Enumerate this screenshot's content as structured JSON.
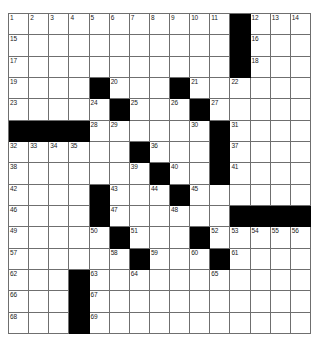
{
  "puzzle": {
    "type": "crossword-grid",
    "rows": 15,
    "columns": 15,
    "cell_color": "#ffffff",
    "block_color": "#000000",
    "line_color": "#6f6f6f",
    "number_color": "#1a1a1a",
    "grid": [
      [
        {
          "n": "1"
        },
        {
          "n": "2"
        },
        {
          "n": "3"
        },
        {
          "n": "4"
        },
        {
          "n": "5"
        },
        {
          "n": "6"
        },
        {
          "n": "7"
        },
        {
          "n": "8"
        },
        {
          "n": "9"
        },
        {
          "n": "10"
        },
        {
          "n": "11"
        },
        {
          "b": true
        },
        {
          "n": "12"
        },
        {
          "n": "13"
        },
        {
          "n": "14"
        }
      ],
      [
        {
          "n": "15"
        },
        {},
        {},
        {},
        {},
        {},
        {},
        {},
        {},
        {},
        {},
        {
          "b": true
        },
        {
          "n": "16"
        },
        {},
        {}
      ],
      [
        {
          "n": "17"
        },
        {},
        {},
        {},
        {},
        {},
        {},
        {},
        {},
        {},
        {},
        {
          "b": true
        },
        {
          "n": "18"
        },
        {},
        {}
      ],
      [
        {
          "n": "19"
        },
        {},
        {},
        {},
        {
          "b": true
        },
        {
          "n": "20"
        },
        {},
        {},
        {
          "b": true
        },
        {
          "n": "21"
        },
        {},
        {
          "n": "22"
        },
        {},
        {},
        {}
      ],
      [
        {
          "n": "23"
        },
        {},
        {},
        {},
        {
          "n": "24"
        },
        {
          "b": true
        },
        {
          "n": "25"
        },
        {},
        {
          "n": "26"
        },
        {
          "b": true
        },
        {
          "n": "27"
        },
        {},
        {},
        {},
        {}
      ],
      [
        {
          "b": true
        },
        {
          "b": true
        },
        {
          "b": true
        },
        {
          "b": true
        },
        {
          "n": "28"
        },
        {
          "n": "29"
        },
        {},
        {},
        {},
        {
          "n": "30"
        },
        {
          "b": true
        },
        {
          "n": "31"
        },
        {},
        {},
        {}
      ],
      [
        {
          "n": "32"
        },
        {
          "n": "33"
        },
        {
          "n": "34"
        },
        {
          "n": "35"
        },
        {},
        {},
        {
          "b": true
        },
        {
          "n": "36"
        },
        {},
        {},
        {
          "b": true
        },
        {
          "n": "37"
        },
        {},
        {},
        {}
      ],
      [
        {
          "n": "38"
        },
        {},
        {},
        {},
        {},
        {},
        {
          "n": "39"
        },
        {
          "b": true
        },
        {
          "n": "40"
        },
        {},
        {
          "b": true
        },
        {
          "n": "41"
        },
        {},
        {},
        {}
      ],
      [
        {
          "n": "42"
        },
        {},
        {},
        {},
        {
          "b": true
        },
        {
          "n": "43"
        },
        {},
        {
          "n": "44"
        },
        {
          "b": true
        },
        {
          "n": "45"
        },
        {},
        {},
        {},
        {},
        {}
      ],
      [
        {
          "n": "46"
        },
        {},
        {},
        {},
        {
          "b": true
        },
        {
          "n": "47"
        },
        {},
        {},
        {
          "n": "48"
        },
        {},
        {},
        {
          "b": true
        },
        {
          "b": true
        },
        {
          "b": true
        },
        {
          "b": true
        }
      ],
      [
        {
          "n": "49"
        },
        {},
        {},
        {},
        {
          "n": "50"
        },
        {
          "b": true
        },
        {
          "n": "51"
        },
        {},
        {},
        {
          "b": true
        },
        {
          "n": "52"
        },
        {
          "n": "53"
        },
        {
          "n": "54"
        },
        {
          "n": "55"
        },
        {
          "n": "56"
        }
      ],
      [
        {
          "n": "57"
        },
        {},
        {},
        {},
        {},
        {
          "n": "58"
        },
        {
          "b": true
        },
        {
          "n": "59"
        },
        {},
        {
          "n": "60"
        },
        {
          "b": true
        },
        {
          "n": "61"
        },
        {},
        {},
        {}
      ],
      [
        {
          "n": "62"
        },
        {},
        {},
        {
          "b": true
        },
        {
          "n": "63"
        },
        {},
        {
          "n": "64"
        },
        {},
        {},
        {},
        {
          "n": "65"
        },
        {},
        {},
        {},
        {}
      ],
      [
        {
          "n": "66"
        },
        {},
        {},
        {
          "b": true
        },
        {
          "n": "67"
        },
        {},
        {},
        {},
        {},
        {},
        {},
        {},
        {},
        {},
        {}
      ],
      [
        {
          "n": "68"
        },
        {},
        {},
        {
          "b": true
        },
        {
          "n": "69"
        },
        {},
        {},
        {},
        {},
        {},
        {},
        {},
        {},
        {},
        {}
      ]
    ]
  }
}
